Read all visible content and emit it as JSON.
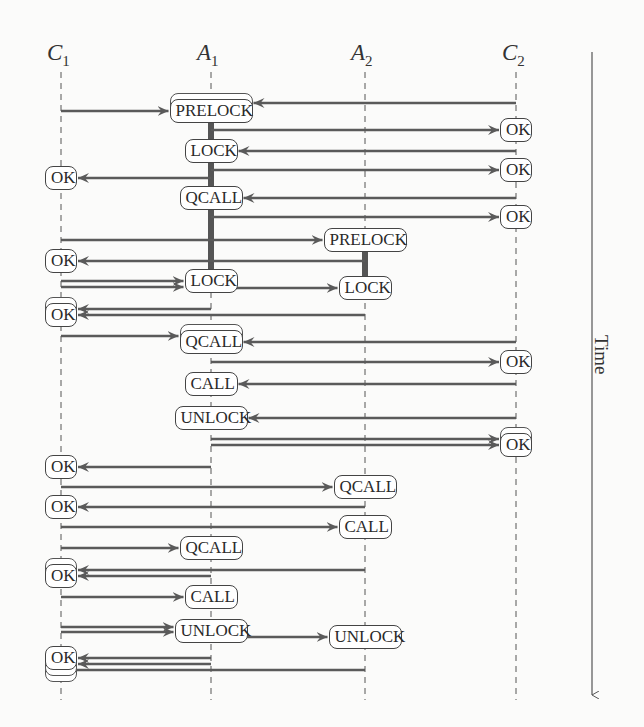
{
  "lifelines": [
    {
      "id": "C1",
      "label": "C",
      "sub": "1",
      "x": 61
    },
    {
      "id": "A1",
      "label": "A",
      "sub": "1",
      "x": 211
    },
    {
      "id": "A2",
      "label": "A",
      "sub": "2",
      "x": 365
    },
    {
      "id": "C2",
      "label": "C",
      "sub": "2",
      "x": 516
    }
  ],
  "time_axis": {
    "label": "Time",
    "x": 592,
    "y_start": 52,
    "y_end": 695
  },
  "boxes": [
    {
      "id": "b1",
      "lifeline": "A1",
      "y": 111,
      "label": "PRELOCK",
      "stacked": 2
    },
    {
      "id": "b2",
      "lifeline": "C2",
      "y": 130,
      "label": "OK",
      "stacked": 1
    },
    {
      "id": "b3",
      "lifeline": "A1",
      "y": 151,
      "label": "LOCK",
      "stacked": 1
    },
    {
      "id": "b4",
      "lifeline": "C2",
      "y": 170,
      "label": "OK",
      "stacked": 1
    },
    {
      "id": "b5",
      "lifeline": "C1",
      "y": 178,
      "label": "OK",
      "stacked": 1
    },
    {
      "id": "b6",
      "lifeline": "A1",
      "y": 198,
      "label": "QCALL",
      "stacked": 1
    },
    {
      "id": "b7",
      "lifeline": "C2",
      "y": 217,
      "label": "OK",
      "stacked": 1
    },
    {
      "id": "b8",
      "lifeline": "A2",
      "y": 240,
      "label": "PRELOCK",
      "stacked": 1
    },
    {
      "id": "b9",
      "lifeline": "C1",
      "y": 261,
      "label": "OK",
      "stacked": 1
    },
    {
      "id": "b10",
      "lifeline": "A1",
      "y": 281,
      "label": "LOCK",
      "stacked": 1
    },
    {
      "id": "b11",
      "lifeline": "A2",
      "y": 288,
      "label": "LOCK",
      "stacked": 1
    },
    {
      "id": "b12",
      "lifeline": "C1",
      "y": 315,
      "label": "OK",
      "stacked": 2
    },
    {
      "id": "b13",
      "lifeline": "A1",
      "y": 342,
      "label": "QCALL",
      "stacked": 2
    },
    {
      "id": "b14",
      "lifeline": "C2",
      "y": 362,
      "label": "OK",
      "stacked": 1
    },
    {
      "id": "b15",
      "lifeline": "A1",
      "y": 384,
      "label": "CALL",
      "stacked": 1
    },
    {
      "id": "b16",
      "lifeline": "A1",
      "y": 418,
      "label": "UNLOCK",
      "stacked": 1
    },
    {
      "id": "b17",
      "lifeline": "C2",
      "y": 445,
      "label": "OK",
      "stacked": 2
    },
    {
      "id": "b18",
      "lifeline": "C1",
      "y": 467,
      "label": "OK",
      "stacked": 1
    },
    {
      "id": "b19",
      "lifeline": "A2",
      "y": 487,
      "label": "QCALL",
      "stacked": 1
    },
    {
      "id": "b20",
      "lifeline": "C1",
      "y": 507,
      "label": "OK",
      "stacked": 1
    },
    {
      "id": "b21",
      "lifeline": "A2",
      "y": 527,
      "label": "CALL",
      "stacked": 1
    },
    {
      "id": "b22",
      "lifeline": "A1",
      "y": 548,
      "label": "QCALL",
      "stacked": 1
    },
    {
      "id": "b23",
      "lifeline": "C1",
      "y": 576,
      "label": "OK",
      "stacked": 2
    },
    {
      "id": "b24",
      "lifeline": "A1",
      "y": 597,
      "label": "CALL",
      "stacked": 1
    },
    {
      "id": "b25",
      "lifeline": "A1",
      "y": 631,
      "label": "UNLOCK",
      "stacked": 1
    },
    {
      "id": "b26",
      "lifeline": "A2",
      "y": 637,
      "label": "UNLOCK",
      "stacked": 1
    },
    {
      "id": "b27",
      "lifeline": "C1",
      "y": 658,
      "label": "OK",
      "stacked": 3
    }
  ],
  "messages": [
    {
      "from": "C1",
      "to": "A1",
      "y": 111
    },
    {
      "from": "C2",
      "to": "A1",
      "y": 103
    },
    {
      "from": "A1",
      "to": "C2",
      "y": 130
    },
    {
      "from": "C2",
      "to": "A1",
      "y": 151
    },
    {
      "from": "A1",
      "to": "C2",
      "y": 170
    },
    {
      "from": "A1",
      "to": "C1",
      "y": 178
    },
    {
      "from": "C2",
      "to": "A1",
      "y": 198
    },
    {
      "from": "A1",
      "to": "C2",
      "y": 217
    },
    {
      "from": "C1",
      "to": "A2",
      "y": 240
    },
    {
      "from": "A2",
      "to": "C1",
      "y": 261
    },
    {
      "from": "C1",
      "to": "A1",
      "y": 281
    },
    {
      "from": "C1",
      "to": "A1",
      "y": 287
    },
    {
      "from": "A1",
      "to": "A2",
      "y": 288
    },
    {
      "from": "A1",
      "to": "C1",
      "y": 309
    },
    {
      "from": "A2",
      "to": "C1",
      "y": 315
    },
    {
      "from": "C1",
      "to": "A1",
      "y": 336
    },
    {
      "from": "C2",
      "to": "A1",
      "y": 342
    },
    {
      "from": "A1",
      "to": "C2",
      "y": 362
    },
    {
      "from": "C2",
      "to": "A1",
      "y": 384
    },
    {
      "from": "C2",
      "to": "A1",
      "y": 418
    },
    {
      "from": "A1",
      "to": "C2",
      "y": 439
    },
    {
      "from": "A1",
      "to": "C2",
      "y": 445
    },
    {
      "from": "A1",
      "to": "C1",
      "y": 467
    },
    {
      "from": "C1",
      "to": "A2",
      "y": 487
    },
    {
      "from": "A2",
      "to": "C1",
      "y": 507
    },
    {
      "from": "C1",
      "to": "A2",
      "y": 527
    },
    {
      "from": "C1",
      "to": "A1",
      "y": 548
    },
    {
      "from": "A2",
      "to": "C1",
      "y": 570
    },
    {
      "from": "A1",
      "to": "C1",
      "y": 576
    },
    {
      "from": "C1",
      "to": "A1",
      "y": 597
    },
    {
      "from": "C1",
      "to": "A1",
      "y": 627
    },
    {
      "from": "C1",
      "to": "A1",
      "y": 632
    },
    {
      "from": "A1",
      "to": "A2",
      "y": 637
    },
    {
      "from": "A1",
      "to": "C1",
      "y": 658
    },
    {
      "from": "A1",
      "to": "C1",
      "y": 664
    },
    {
      "from": "A2",
      "to": "C1",
      "y": 670
    }
  ],
  "lock_bars": [
    {
      "lifeline": "A1",
      "y_start": 123,
      "y_end": 281
    },
    {
      "lifeline": "A2",
      "y_start": 252,
      "y_end": 276
    }
  ],
  "colors": {
    "line": "#5a5a5a",
    "lock_bar": "#555555",
    "box_border": "#444444",
    "text": "#2a2a2a"
  }
}
